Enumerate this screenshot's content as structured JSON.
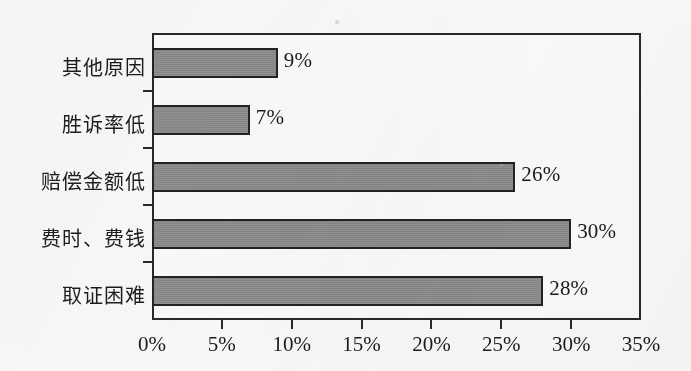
{
  "chart_data": {
    "type": "bar",
    "orientation": "horizontal",
    "title": "",
    "subtitle": "",
    "xlabel": "",
    "ylabel": "",
    "categories": [
      "其他原因",
      "胜诉率低",
      "赔偿金额低",
      "费时、费钱",
      "取证困难"
    ],
    "values": [
      9,
      7,
      26,
      30,
      28
    ],
    "data_labels": [
      "9%",
      "7%",
      "26%",
      "30%",
      "28%"
    ],
    "xlim": [
      0,
      35
    ],
    "xticks": [
      0,
      5,
      10,
      15,
      20,
      25,
      30,
      35
    ],
    "xtick_labels": [
      "0%",
      "5%",
      "10%",
      "15%",
      "20%",
      "25%",
      "30%",
      "35%"
    ],
    "grid": false,
    "legend": null,
    "legend_position": "none",
    "annotations": [],
    "colors": {
      "bar_fill": "#8e8e8e",
      "bar_border": "#232323",
      "axis": "#2a2a2a",
      "text": "#1b1b1b",
      "background": "#fcfcfa"
    }
  }
}
